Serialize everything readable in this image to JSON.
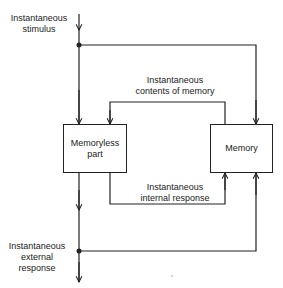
{
  "diagram": {
    "labels": {
      "stimulus": [
        "Instantaneous",
        "stimulus"
      ],
      "contents": [
        "Instantaneous",
        "contents  of  memory"
      ],
      "internal": [
        "Instantaneous",
        "internal   response"
      ],
      "external": [
        "Instantaneous",
        "external",
        "response"
      ]
    },
    "boxes": {
      "memoryless": [
        "Memoryless",
        "part"
      ],
      "memory": "Memory"
    }
  }
}
